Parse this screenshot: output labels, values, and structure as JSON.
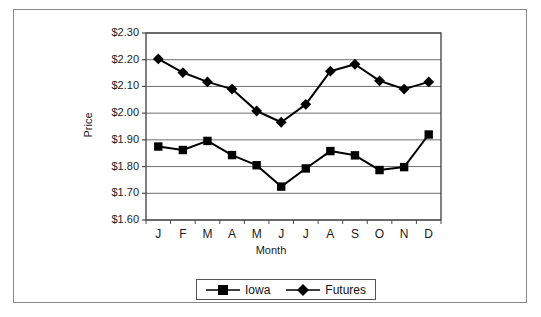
{
  "chart_data": {
    "type": "line",
    "title": "",
    "xlabel": "Month",
    "ylabel": "Price",
    "categories": [
      "J",
      "F",
      "M",
      "A",
      "M",
      "J",
      "J",
      "A",
      "S",
      "O",
      "N",
      "D"
    ],
    "ylim": [
      1.6,
      2.3
    ],
    "ytick_labels": [
      "$1.60",
      "$1.70",
      "$1.80",
      "$1.90",
      "$2.00",
      "$2.10",
      "$2.20",
      "$2.30"
    ],
    "ytick_values": [
      1.6,
      1.7,
      1.8,
      1.9,
      2.0,
      2.1,
      2.2,
      2.3
    ],
    "grid": "horizontal",
    "legend_position": "bottom-center",
    "series": [
      {
        "name": "Iowa",
        "marker": "square",
        "color": "#000000",
        "values": [
          1.875,
          1.862,
          1.896,
          1.843,
          1.805,
          1.725,
          1.793,
          1.858,
          1.842,
          1.787,
          1.798,
          1.92
        ]
      },
      {
        "name": "Futures",
        "marker": "diamond",
        "color": "#000000",
        "values": [
          2.203,
          2.152,
          2.117,
          2.09,
          2.008,
          1.966,
          2.033,
          2.157,
          2.183,
          2.121,
          2.09,
          2.117
        ]
      }
    ]
  },
  "legend": {
    "items": [
      {
        "label": "Iowa",
        "marker": "square"
      },
      {
        "label": "Futures",
        "marker": "diamond"
      }
    ]
  },
  "axes": {
    "y_title": "Price",
    "x_title": "Month"
  }
}
